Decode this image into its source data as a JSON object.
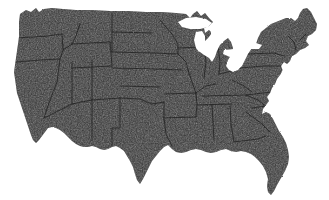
{
  "page": {
    "title": "Map of the Contiguous United States",
    "width": 329,
    "height": 200
  },
  "map": {
    "name": "contiguous-united-states",
    "projection_look": "albers-usa",
    "background_color": "#ffffff",
    "land_fill_color": "#3e3e3e",
    "land_grain_dark": "#262626",
    "land_grain_light": "#5a5a5a",
    "state_border_color": "#1a1a1a",
    "lake_color": "#ffffff",
    "texture": "dithered-halftone-scan",
    "regions_visible": [
      "west-coast",
      "mountain-west",
      "great-plains",
      "midwest",
      "great-lakes",
      "northeast",
      "south",
      "gulf-coast",
      "florida-peninsula"
    ],
    "water_features": [
      "lake-superior",
      "lake-michigan",
      "lake-huron",
      "lake-erie",
      "lake-ontario",
      "chesapeake-bay",
      "san-francisco-bay",
      "gulf-of-mexico",
      "atlantic-ocean",
      "pacific-ocean"
    ],
    "bounds": {
      "left": 14,
      "right": 318,
      "top": 7,
      "bottom": 195
    }
  }
}
